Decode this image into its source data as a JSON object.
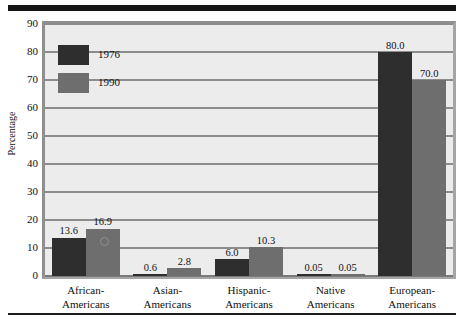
{
  "chart_data": {
    "type": "bar",
    "title": "",
    "xlabel": "",
    "ylabel": "Percentage",
    "ylim": [
      0,
      90
    ],
    "ytick_step": 10,
    "yticks": [
      "0",
      "10",
      "20",
      "30",
      "40",
      "50",
      "60",
      "70",
      "80",
      "90"
    ],
    "grid": "horizontal",
    "legend_position": "upper-left-inside",
    "categories": [
      "African-\nAmericans",
      "Asian-\nAmericans",
      "Hispanic-\nAmericans",
      "Native\nAmericans",
      "European-\nAmericans"
    ],
    "category_lines": [
      [
        "African-",
        "Americans"
      ],
      [
        "Asian-",
        "Americans"
      ],
      [
        "Hispanic-",
        "Americans"
      ],
      [
        "Native",
        "Americans"
      ],
      [
        "European-",
        "Americans"
      ]
    ],
    "series": [
      {
        "name": "1976",
        "color": "#2e2e2e",
        "values": [
          13.6,
          0.6,
          6.0,
          0.05,
          80.0
        ],
        "labels": [
          "13.6",
          "0.6",
          "6.0",
          "0.05",
          "80.0"
        ]
      },
      {
        "name": "1990",
        "color": "#6e6e6e",
        "values": [
          16.9,
          2.8,
          10.3,
          0.05,
          70.0
        ],
        "labels": [
          "16.9",
          "2.8",
          "10.3",
          "0.05",
          "70.0"
        ]
      }
    ]
  },
  "legend": {
    "items": [
      {
        "label": "1976",
        "color": "#2e2e2e"
      },
      {
        "label": "1990",
        "color": "#6e6e6e"
      }
    ]
  },
  "axis": {
    "y_title": "Percentage"
  },
  "colors": {
    "series_1976": "#2e2e2e",
    "series_1990": "#6e6e6e",
    "plot_background": "#ececed",
    "gridline": "#8c8c8c",
    "frame_border": "#8f8f8f",
    "rule": "#141414"
  }
}
